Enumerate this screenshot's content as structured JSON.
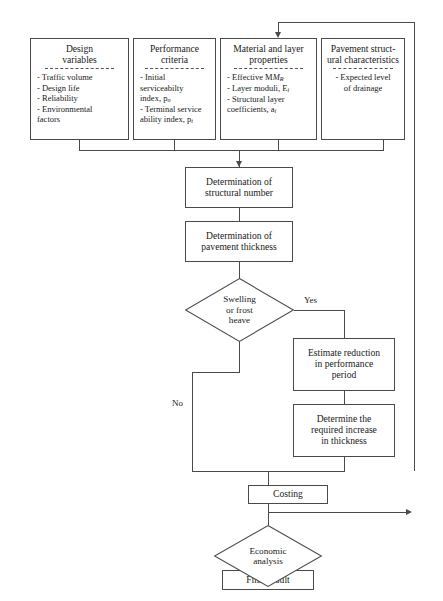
{
  "diagram": {
    "type": "flowchart",
    "inputs": [
      {
        "id": "design-variables",
        "title": "Design\nvariables",
        "items": [
          "- Traffic volume",
          "- Design life",
          "- Reliability",
          "- Environmental\n  factors"
        ]
      },
      {
        "id": "performance-criteria",
        "title": "Performance\ncriteria",
        "items": [
          "- Initial serviceabilty\n   index, p",
          "- Terminal service\n   ability index, p"
        ],
        "item_subscripts": [
          "o",
          "t"
        ]
      },
      {
        "id": "material-layer-properties",
        "title": "Material and layer\nproperties",
        "items": [
          "- Effective M",
          "- Layer moduli, E",
          "- Structural layer\n   coefficients, a"
        ],
        "item_subscripts": [
          "R",
          "i",
          "i"
        ]
      },
      {
        "id": "pavement-structural-characteristics",
        "title": "Pavement struct-\nural characteristics",
        "items": [
          "- Expected level\nof drainage"
        ]
      }
    ],
    "process_nodes": [
      {
        "id": "determination-structural-number",
        "label": "Determination of\nstructural number"
      },
      {
        "id": "determination-pavement-thickness",
        "label": "Determination of\npavement thickness"
      },
      {
        "id": "estimate-reduction",
        "label": "Estimate reduction\nin performance\nperiod"
      },
      {
        "id": "determine-required-increase",
        "label": "Determine the\nrequired increase\nin thickness"
      },
      {
        "id": "costing",
        "label": "Costing"
      },
      {
        "id": "final-result",
        "label": "Final result"
      }
    ],
    "decisions": [
      {
        "id": "swelling-or-frost-heave",
        "label": "Swelling\nor frost\nheave"
      },
      {
        "id": "economic-analysis",
        "label": "Economic\nanalysis"
      }
    ],
    "edge_labels": {
      "yes": "Yes",
      "no": "No"
    },
    "colors": {
      "stroke": "#4a4a4a",
      "text": "#1a1a1a",
      "background": "#ffffff"
    }
  }
}
